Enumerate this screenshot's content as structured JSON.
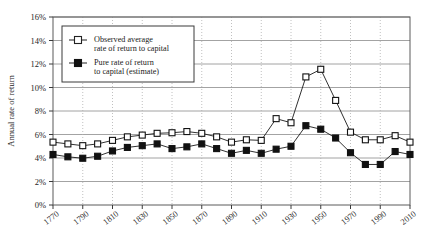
{
  "chart_data": {
    "type": "line",
    "title": "",
    "xlabel": "",
    "ylabel": "Annual rate of return",
    "xlim": [
      1770,
      2010
    ],
    "ylim": [
      0,
      16
    ],
    "grid": true,
    "legend_position": "top-left",
    "x": [
      1770,
      1780,
      1790,
      1800,
      1810,
      1820,
      1830,
      1840,
      1850,
      1860,
      1870,
      1880,
      1890,
      1900,
      1910,
      1920,
      1930,
      1940,
      1950,
      1960,
      1970,
      1980,
      1990,
      2000,
      2010
    ],
    "xticks": [
      1770,
      1790,
      1810,
      1830,
      1850,
      1870,
      1890,
      1910,
      1930,
      1950,
      1970,
      1990,
      2010
    ],
    "xtick_labels": [
      "1770",
      "1790",
      "1810",
      "1830",
      "1850",
      "1870",
      "1890",
      "1910",
      "1930",
      "1950",
      "1970",
      "1990",
      "2010"
    ],
    "yticks": [
      0,
      2,
      4,
      6,
      8,
      10,
      12,
      14,
      16
    ],
    "ytick_labels": [
      "0%",
      "2%",
      "4%",
      "6%",
      "8%",
      "10%",
      "12%",
      "14%",
      "16%"
    ],
    "series": [
      {
        "name": "Observed average rate of return to capital",
        "marker": "open-square",
        "values": [
          5.35,
          5.2,
          5.05,
          5.2,
          5.5,
          5.8,
          5.95,
          6.1,
          6.15,
          6.25,
          6.1,
          5.8,
          5.35,
          5.55,
          5.5,
          7.35,
          7.0,
          10.9,
          11.55,
          8.9,
          6.2,
          5.55,
          5.55,
          5.9,
          5.35
        ]
      },
      {
        "name": "Pure rate of return to capital (estimate)",
        "marker": "filled-square",
        "values": [
          4.3,
          4.1,
          3.98,
          4.15,
          4.6,
          4.9,
          5.05,
          5.2,
          4.8,
          4.95,
          5.2,
          4.8,
          4.4,
          4.65,
          4.4,
          4.75,
          5.0,
          6.75,
          6.45,
          5.7,
          4.45,
          3.45,
          3.45,
          4.55,
          4.3
        ]
      }
    ]
  },
  "legend": {
    "entries": [
      {
        "line1": "Observed average",
        "line2": "rate of return to capital",
        "marker": "open-square"
      },
      {
        "line1": "Pure rate of return",
        "line2": "to capital (estimate)",
        "marker": "filled-square"
      }
    ]
  },
  "axis": {
    "y_title": "Annual rate of return"
  }
}
